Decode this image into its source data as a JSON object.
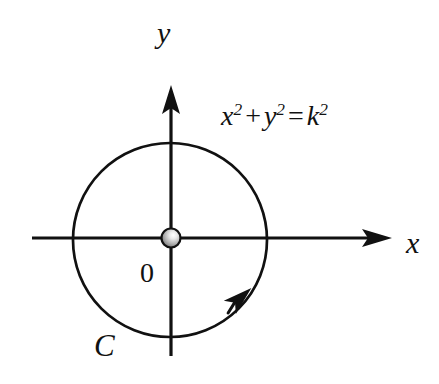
{
  "figure": {
    "background_color": "#ffffff",
    "stroke_color": "#111111",
    "width": 439,
    "height": 384
  },
  "axes": {
    "x_axis": {
      "label": "x",
      "icon": "arrow-right-icon",
      "start_x": 32,
      "end_x": 392,
      "y": 238
    },
    "y_axis": {
      "label": "y",
      "icon": "arrow-up-icon",
      "x": 171,
      "start_y": 356,
      "end_y": 85
    }
  },
  "origin": {
    "label": "0",
    "marker": "sphere-marker",
    "cx": 171,
    "cy": 238,
    "radius": 9,
    "highlight_color": "#f2f2f2",
    "shade_color": "#8c8c8c"
  },
  "circle": {
    "label": "C",
    "cx": 170,
    "cy": 240,
    "radius": 97,
    "stroke_width": 2.6,
    "orientation": "counterclockwise",
    "orientation_marker": "arrowhead-icon",
    "arrow_angle_deg": 55
  },
  "equation": {
    "full_text": "x^2 + y^2 = k^2",
    "terms": {
      "x_base": "x",
      "x_exp": "2",
      "plus": "+",
      "y_base": "y",
      "y_exp": "2",
      "equals": "=",
      "k_base": "k",
      "k_exp": "2"
    }
  }
}
